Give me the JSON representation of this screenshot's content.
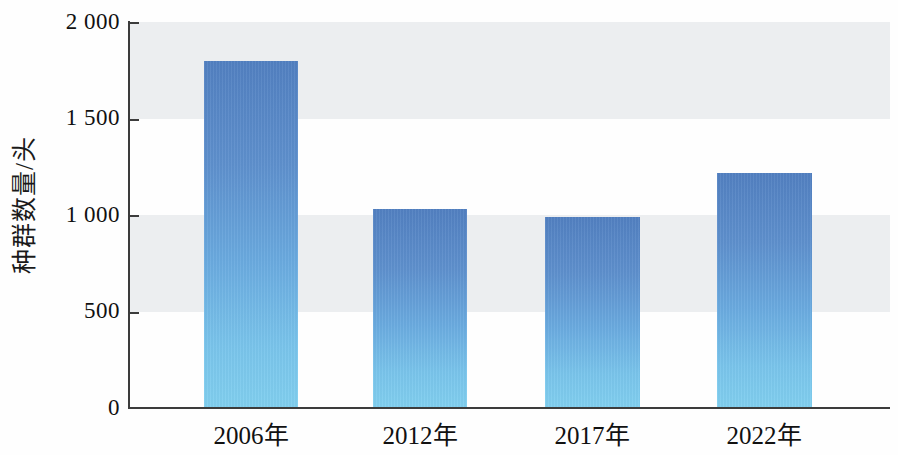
{
  "chart_data": {
    "type": "bar",
    "title": "",
    "subtitle": "",
    "xlabel": "",
    "ylabel": "种群数量/头",
    "categories": [
      "2006年",
      "2012年",
      "2017年",
      "2022年"
    ],
    "category_years": [
      "2006",
      "2012",
      "2017",
      "2022"
    ],
    "category_unit": "年",
    "values": [
      1800,
      1030,
      990,
      1220
    ],
    "ylim": [
      0,
      2000
    ],
    "ytick_values": [
      0,
      500,
      1000,
      1500,
      2000
    ],
    "ytick_labels": [
      "0",
      "500",
      "1 000",
      "1 500",
      "2 000"
    ],
    "grid": false,
    "banding": true,
    "band_color": "#eceef0",
    "legend": null,
    "legend_position": "none",
    "bar_color_top": "#5280c1",
    "bar_color_bottom": "#80cfef",
    "axis_color": "#3c3c3c",
    "background_color": "#ffffff",
    "annotations": []
  },
  "axis": {
    "y_title": "种群数量/头",
    "tick_labels": [
      "2 000",
      "1 500",
      "1 000",
      "500",
      "0"
    ]
  }
}
